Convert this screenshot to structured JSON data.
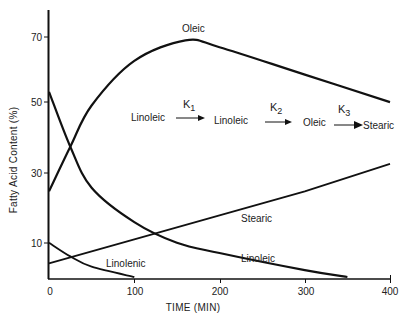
{
  "chart_data": {
    "type": "line",
    "title": "",
    "xlabel": "TIME (MIN)",
    "ylabel": "Fatty Acid Content (%)",
    "xlim": [
      0,
      400
    ],
    "ylim": [
      0,
      78
    ],
    "x_ticks": [
      0,
      100,
      200,
      300,
      400
    ],
    "y_ticks": [
      10,
      30,
      50,
      70
    ],
    "grid": false,
    "legend": "none (curves labeled inline)",
    "series": [
      {
        "name": "Oleic",
        "x": [
          0,
          25,
          50,
          100,
          160,
          200,
          300,
          400
        ],
        "values": [
          25,
          38,
          50,
          63,
          69,
          67,
          59,
          51
        ]
      },
      {
        "name": "Linoleic",
        "x": [
          0,
          25,
          50,
          100,
          150,
          200,
          300,
          350
        ],
        "values": [
          54,
          38,
          26,
          16,
          10,
          7,
          2,
          0
        ]
      },
      {
        "name": "Linolenic",
        "x": [
          0,
          25,
          50,
          100
        ],
        "values": [
          10,
          6,
          3,
          0
        ]
      },
      {
        "name": "Stearic",
        "x": [
          0,
          100,
          200,
          300,
          400
        ],
        "values": [
          4,
          11,
          18,
          25,
          33
        ]
      }
    ],
    "annotations": {
      "reaction_scheme": [
        "Linoleic",
        "K1",
        "Linoleic",
        "K2",
        "Oleic",
        "K3",
        "Stearic"
      ]
    }
  },
  "labels": {
    "oleic": "Oleic",
    "linoleic": "Linoleic",
    "linolenic": "Linolenic",
    "stearic": "Stearic",
    "xlabel": "TIME (MIN)",
    "ylabel": "Fatty Acid Content (%)",
    "xticks": [
      "0",
      "100",
      "200",
      "300",
      "400"
    ],
    "yticks": [
      "70",
      "50",
      "30",
      "10"
    ]
  },
  "scheme": {
    "s1": "Linoleic",
    "k1": "K",
    "k1_sub": "1",
    "s2": "Linoleic",
    "k2": "K",
    "k2_sub": "2",
    "s3": "Oleic",
    "k3": "K",
    "k3_sub": "3",
    "s4": "Stearic"
  }
}
